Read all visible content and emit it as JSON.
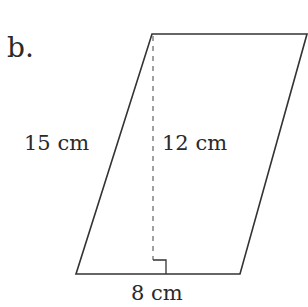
{
  "problem": {
    "label": "b."
  },
  "figure": {
    "shape": "parallelogram",
    "stroke_color": "#333333",
    "vertices": {
      "top_left": [
        152,
        34
      ],
      "top_right": [
        307,
        34
      ],
      "bottom_right": [
        240,
        274
      ],
      "bottom_left": [
        76,
        274
      ]
    },
    "height_line": {
      "x": 153,
      "y1": 34,
      "y2": 274,
      "style": "dashed"
    },
    "right_angle_marker": {
      "x": 153,
      "y": 260,
      "size": 13
    },
    "labels": {
      "side": "15 cm",
      "height": "12 cm",
      "base": "8 cm"
    }
  }
}
